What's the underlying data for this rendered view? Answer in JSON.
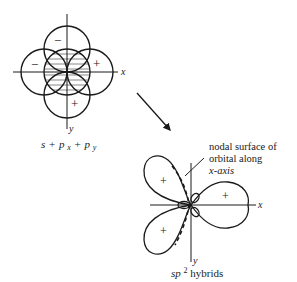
{
  "diagram": {
    "left": {
      "axis_x_label": "x",
      "axis_y_label": "y",
      "signs": {
        "top": "−",
        "left": "−",
        "right": "+",
        "bottom": "+"
      },
      "caption": {
        "s": "s",
        "plus1": "+",
        "p": "p",
        "sub_x": "x",
        "plus2": "+",
        "sub_y": "y"
      }
    },
    "right": {
      "axis_x_label": "x",
      "axis_y_label": "y",
      "lobe_signs": {
        "upper_left": "+",
        "right": "+",
        "lower_left": "+"
      },
      "annotation": [
        "nodal surface of",
        "orbital along",
        "x-axis"
      ],
      "caption": {
        "sp": "sp",
        "sup": "2",
        "rest": " hybrids"
      }
    },
    "colors": {
      "stroke": "#1a1a1a",
      "background": "#ffffff"
    }
  }
}
